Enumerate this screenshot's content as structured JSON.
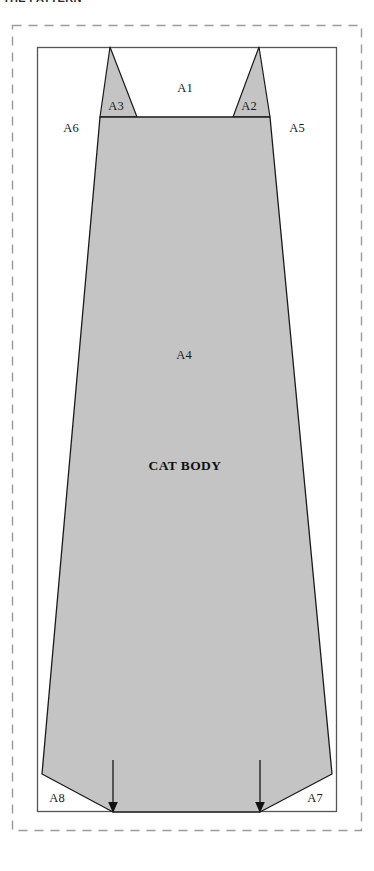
{
  "caption": {
    "text": "THE PATTERN"
  },
  "figure": {
    "name": "cat-body-pattern-diagram",
    "title_label": "CAT BODY",
    "colors": {
      "body_fill": "#c4c4c4",
      "outline": "#1a1a1a",
      "frame_stroke": "#555555",
      "dashed_border": "#9a9a9a",
      "background": "#ffffff"
    },
    "labels": {
      "a1": "A1",
      "a2": "A2",
      "a3": "A3",
      "a4": "A4",
      "a5": "A5",
      "a6": "A6",
      "a7": "A7",
      "a8": "A8"
    },
    "arrows": {
      "count": 2,
      "direction": "down",
      "left_x": 113,
      "right_x": 260
    }
  }
}
